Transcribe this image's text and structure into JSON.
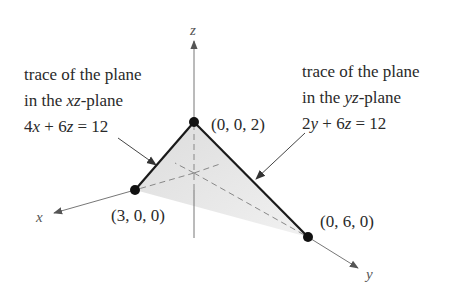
{
  "figure": {
    "axes": {
      "x_label": "x",
      "y_label": "y",
      "z_label": "z"
    },
    "points": [
      {
        "name": "x-intercept",
        "coords": [
          3,
          0,
          0
        ],
        "label": "(3, 0, 0)"
      },
      {
        "name": "y-intercept",
        "coords": [
          0,
          6,
          0
        ],
        "label": "(0, 6, 0)"
      },
      {
        "name": "z-intercept",
        "coords": [
          0,
          0,
          2
        ],
        "label": "(0, 0, 2)"
      }
    ],
    "left_caption": {
      "line1": "trace of the plane",
      "line2_prefix": "in the ",
      "line2_var": "xz",
      "line2_suffix": "-plane",
      "eq_a": "4",
      "eq_var1": "x",
      "eq_mid": " + 6",
      "eq_var2": "z",
      "eq_end": " = 12"
    },
    "right_caption": {
      "line1": "trace of the plane",
      "line2_prefix": "in the ",
      "line2_var": "yz",
      "line2_suffix": "-plane",
      "eq_a": "2",
      "eq_var1": "y",
      "eq_mid": " + 6",
      "eq_var2": "z",
      "eq_end": " = 12"
    },
    "colors": {
      "plane_fill": "#e6e6e6",
      "trace_line": "#1a1a1a",
      "axis_line": "#666666",
      "point": "#111111"
    }
  }
}
